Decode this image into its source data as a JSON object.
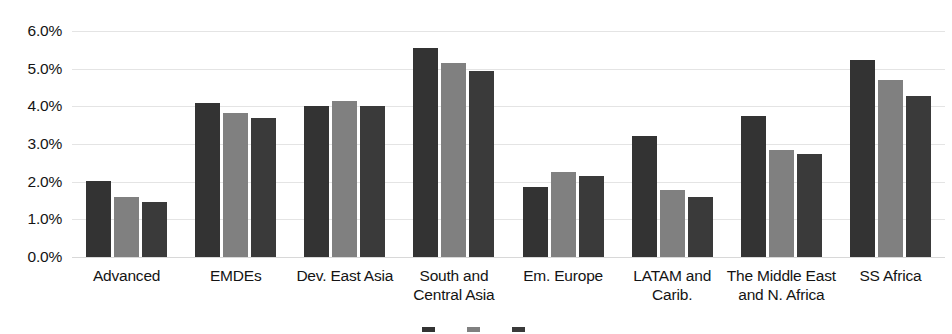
{
  "chart_data": {
    "type": "bar",
    "title": "",
    "xlabel": "",
    "ylabel": "",
    "ylim": [
      0,
      6
    ],
    "grid": true,
    "legend_position": "bottom",
    "y_ticks": [
      "0.0%",
      "1.0%",
      "2.0%",
      "3.0%",
      "4.0%",
      "5.0%",
      "6.0%"
    ],
    "y_tick_values": [
      0,
      1,
      2,
      3,
      4,
      5,
      6
    ],
    "categories": [
      "Advanced",
      "EMDEs",
      "Dev. East Asia",
      "South and Central Asia",
      "Em. Europe",
      "LATAM and Carib.",
      "The Middle East and N. Africa",
      "SS Africa"
    ],
    "series": [
      {
        "name": "",
        "color": "#333333",
        "values": [
          2.02,
          4.1,
          4.02,
          5.55,
          1.85,
          3.22,
          3.75,
          5.22
        ]
      },
      {
        "name": "",
        "color": "#808080",
        "values": [
          1.6,
          3.83,
          4.15,
          5.15,
          2.27,
          1.78,
          2.85,
          4.7
        ]
      },
      {
        "name": "",
        "color": "#3a3a3a",
        "values": [
          1.45,
          3.7,
          4.02,
          4.95,
          2.15,
          1.6,
          2.73,
          4.27
        ]
      }
    ],
    "colors": {
      "series_1": "#333333",
      "series_2": "#808080",
      "series_3": "#3a3a3a",
      "gridline": "#e4e4e4",
      "background": "#ffffff",
      "text": "#141414"
    }
  },
  "legend": {
    "clipped": true,
    "items": [
      {
        "label": "",
        "color": "#333333"
      },
      {
        "label": "",
        "color": "#808080"
      },
      {
        "label": "",
        "color": "#3a3a3a"
      }
    ]
  }
}
